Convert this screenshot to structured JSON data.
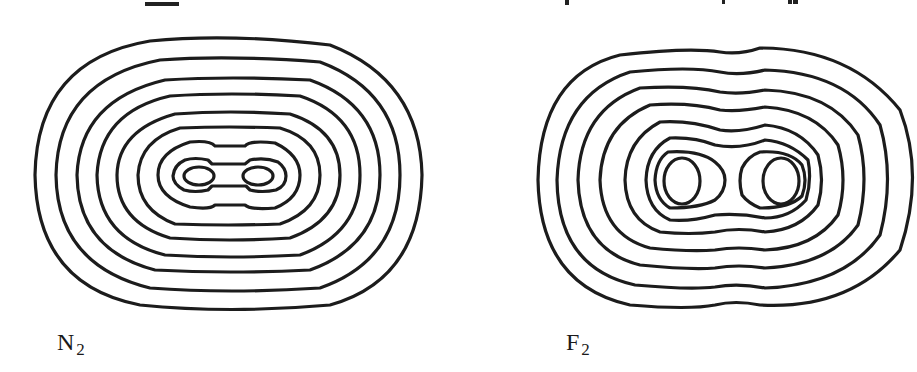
{
  "figure": {
    "type": "electron density contour maps",
    "panels": [
      {
        "id": "n2",
        "label": {
          "main": "N",
          "subscript": "2"
        },
        "nuclei_marker": "×",
        "nuclei_count": 2,
        "contour_count": 10
      },
      {
        "id": "f2",
        "label": {
          "main": "F",
          "subscript": "2"
        },
        "nuclei_marker": "×",
        "nuclei_count": 2,
        "contour_count": 10
      }
    ]
  },
  "colors": {
    "line": "#1c1c1c",
    "background": "#ffffff"
  }
}
